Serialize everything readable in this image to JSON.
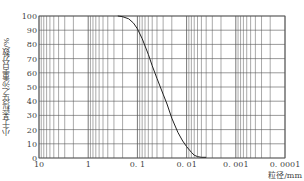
{
  "chart_data": {
    "type": "line",
    "title": "",
    "xlabel": "粒径/mm",
    "ylabel": "小于某粒径之沙重百分数/%",
    "x_scale": "log",
    "x_reversed": true,
    "xlim": [
      10,
      0.0001
    ],
    "ylim": [
      0,
      100
    ],
    "x_ticks": [
      "10",
      "1",
      "0.1",
      "0.01",
      "0.001",
      "0.0001"
    ],
    "y_ticks": [
      "0",
      "10",
      "20",
      "30",
      "40",
      "50",
      "60",
      "70",
      "80",
      "90",
      "100"
    ],
    "grid": true,
    "legend": null,
    "series": [
      {
        "name": "grain size distribution",
        "x": [
          0.25,
          0.2,
          0.15,
          0.12,
          0.1,
          0.08,
          0.06,
          0.05,
          0.04,
          0.03,
          0.025,
          0.02,
          0.015,
          0.012,
          0.01,
          0.008,
          0.007,
          0.006,
          0.005,
          0.004
        ],
        "values": [
          100,
          99.5,
          98,
          95,
          91,
          84,
          73,
          65,
          56,
          45,
          38,
          28,
          18,
          12,
          8,
          4,
          2,
          1,
          0.5,
          0.5
        ]
      }
    ]
  },
  "labels": {
    "ylabel": "小于某粒径之沙重百分数/%",
    "xlabel": "粒径/mm"
  },
  "colors": {
    "grid": "#555555",
    "curve": "#222222",
    "text": "#444444"
  }
}
